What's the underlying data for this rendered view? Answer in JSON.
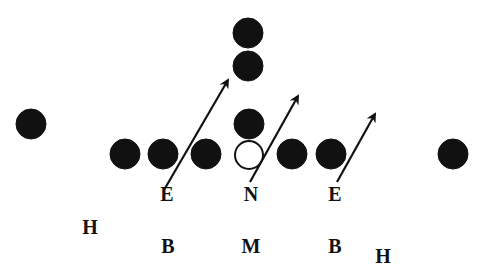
{
  "diagram": {
    "type": "football-defensive-formation",
    "colors": {
      "background": "#ffffff",
      "player_fill": "#111111",
      "open_player_fill": "#ffffff",
      "stroke": "#111111",
      "text": "#111111"
    },
    "offense_players": [
      {
        "id": "wide-left",
        "cx": 31,
        "cy": 124,
        "r": 15,
        "filled": true
      },
      {
        "id": "line-1",
        "cx": 125,
        "cy": 154,
        "r": 15,
        "filled": true
      },
      {
        "id": "line-2",
        "cx": 163,
        "cy": 154,
        "r": 15,
        "filled": true
      },
      {
        "id": "line-3",
        "cx": 206,
        "cy": 154,
        "r": 15,
        "filled": true
      },
      {
        "id": "center",
        "cx": 249,
        "cy": 155,
        "r": 14,
        "filled": false
      },
      {
        "id": "quarterback",
        "cx": 249,
        "cy": 124,
        "r": 15,
        "filled": true
      },
      {
        "id": "back-1",
        "cx": 248,
        "cy": 66,
        "r": 15,
        "filled": true
      },
      {
        "id": "back-2",
        "cx": 248,
        "cy": 33,
        "r": 15,
        "filled": true
      },
      {
        "id": "line-5",
        "cx": 292,
        "cy": 154,
        "r": 15,
        "filled": true
      },
      {
        "id": "line-6",
        "cx": 331,
        "cy": 154,
        "r": 15,
        "filled": true
      },
      {
        "id": "wide-right",
        "cx": 453,
        "cy": 154,
        "r": 15,
        "filled": true
      }
    ],
    "rush_arrows": [
      {
        "id": "left-end-rush",
        "x1": 164,
        "y1": 190,
        "x2": 228,
        "y2": 80
      },
      {
        "id": "nose-rush",
        "x1": 250,
        "y1": 182,
        "x2": 298,
        "y2": 96
      },
      {
        "id": "right-end-rush",
        "x1": 337,
        "y1": 182,
        "x2": 375,
        "y2": 114
      }
    ],
    "defense_labels": [
      {
        "id": "left-end",
        "text": "E",
        "x": 167,
        "y": 201
      },
      {
        "id": "nose",
        "text": "N",
        "x": 251,
        "y": 201
      },
      {
        "id": "right-end",
        "text": "E",
        "x": 335,
        "y": 201
      },
      {
        "id": "left-half",
        "text": "H",
        "x": 90,
        "y": 234
      },
      {
        "id": "left-back",
        "text": "B",
        "x": 168,
        "y": 253
      },
      {
        "id": "middle",
        "text": "M",
        "x": 251,
        "y": 253
      },
      {
        "id": "right-back",
        "text": "B",
        "x": 335,
        "y": 253
      },
      {
        "id": "right-half",
        "text": "H",
        "x": 383,
        "y": 263
      }
    ]
  }
}
